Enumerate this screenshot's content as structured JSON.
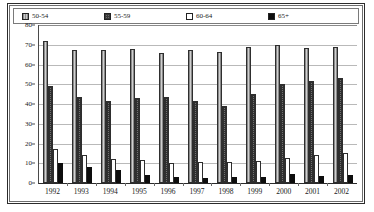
{
  "chart_data": {
    "type": "bar",
    "title": "",
    "subtitle": "",
    "xlabel": "",
    "ylabel": "",
    "ylim": [
      0,
      80
    ],
    "y_ticks": [
      0,
      10,
      20,
      30,
      40,
      50,
      60,
      70,
      80
    ],
    "grid": true,
    "legend_position": "top",
    "categories": [
      "1992",
      "1993",
      "1994",
      "1995",
      "1996",
      "1997",
      "1998",
      "1999",
      "2000",
      "2001",
      "2002"
    ],
    "series": [
      {
        "name": "50-54",
        "swatch": "light-gray-vertical-hatch",
        "color": "#a8a8a8",
        "values": [
          72,
          67.5,
          67.5,
          68,
          66,
          67.5,
          66.5,
          69,
          70,
          68.5,
          69
        ]
      },
      {
        "name": "55-59",
        "swatch": "dark-checkered",
        "color": "#707070",
        "values": [
          49,
          43.5,
          41.5,
          43,
          43.5,
          41.5,
          39,
          45,
          50,
          51.5,
          53
        ]
      },
      {
        "name": "60-64",
        "swatch": "white",
        "color": "#ffffff",
        "values": [
          17,
          14,
          12,
          11.5,
          10,
          10.5,
          10.5,
          11,
          12.5,
          14,
          15
        ]
      },
      {
        "name": "65+",
        "swatch": "solid-black",
        "color": "#0d0d0d",
        "values": [
          10,
          8,
          6.5,
          4,
          3,
          2.5,
          3,
          3,
          4.5,
          3.5,
          4
        ]
      }
    ]
  },
  "legend": {
    "items": [
      {
        "label": "50-54"
      },
      {
        "label": "55-59"
      },
      {
        "label": "60-64"
      },
      {
        "label": "65+"
      }
    ]
  }
}
